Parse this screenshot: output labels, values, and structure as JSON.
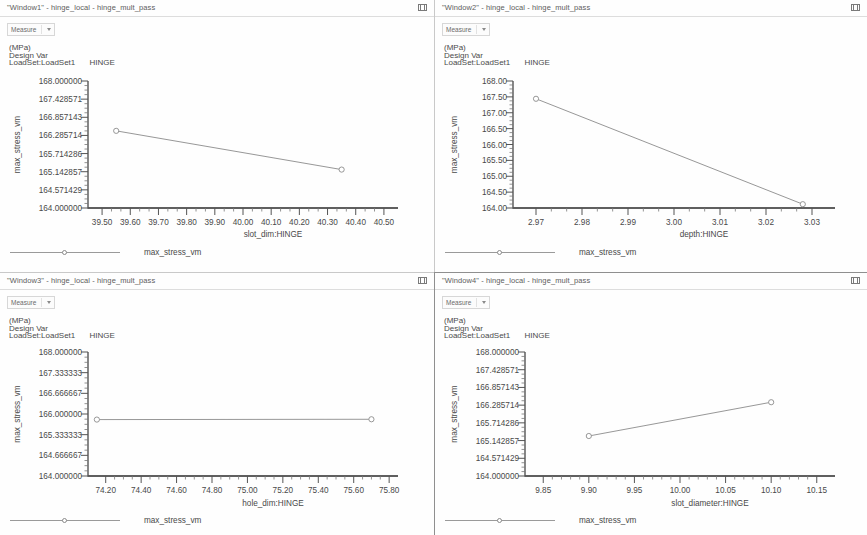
{
  "app": {
    "measure_label": "Measure",
    "close_icon": "window-close-icon",
    "caret_icon": "chevron-down-icon"
  },
  "panels": [
    {
      "title": "\"Window1\" - hinge_local - hinge_mult_pass",
      "info_units": "(MPa)",
      "info_designvar": "Design Var",
      "info_loadset": "LoadSet:LoadSet1",
      "info_hinge": "HINGE",
      "legend_label": "max_stress_vm"
    },
    {
      "title": "\"Window2\" - hinge_local - hinge_mult_pass",
      "info_units": "(MPa)",
      "info_designvar": "Design Var",
      "info_loadset": "LoadSet:LoadSet1",
      "info_hinge": "HINGE",
      "legend_label": "max_stress_vm"
    },
    {
      "title": "\"Window3\" - hinge_local - hinge_mult_pass",
      "info_units": "(MPa)",
      "info_designvar": "Design Var",
      "info_loadset": "LoadSet:LoadSet1",
      "info_hinge": "HINGE",
      "legend_label": "max_stress_vm"
    },
    {
      "title": "\"Window4\" - hinge_local - hinge_mult_pass",
      "info_units": "(MPa)",
      "info_designvar": "Design Var",
      "info_loadset": "LoadSet:LoadSet1",
      "info_hinge": "HINGE",
      "legend_label": "max_stress_vm"
    }
  ],
  "chart_data": [
    {
      "type": "line",
      "title": "",
      "xlabel": "slot_dim:HINGE",
      "ylabel": "max_stress_vm",
      "series": [
        {
          "name": "max_stress_vm",
          "x": [
            39.55,
            40.35
          ],
          "values": [
            166.43,
            165.21
          ]
        }
      ],
      "xlim": [
        39.45,
        40.55
      ],
      "ylim": [
        164.0,
        168.0
      ],
      "xticks": [
        "39.50",
        "39.60",
        "39.70",
        "39.80",
        "39.90",
        "40.00",
        "40.10",
        "40.20",
        "40.30",
        "40.40",
        "40.50"
      ],
      "xtick_values": [
        39.5,
        39.6,
        39.7,
        39.8,
        39.9,
        40.0,
        40.1,
        40.2,
        40.3,
        40.4,
        40.5
      ],
      "yticks": [
        "168.000000",
        "167.428571",
        "166.857143",
        "166.285714",
        "165.714286",
        "165.142857",
        "164.571429",
        "164.000000"
      ],
      "ytick_values": [
        168.0,
        167.428571,
        166.857143,
        166.285714,
        165.714286,
        165.142857,
        164.571429,
        164.0
      ],
      "grid": false,
      "legend_position": "bottom-left"
    },
    {
      "type": "line",
      "title": "",
      "xlabel": "depth:HINGE",
      "ylabel": "max_stress_vm",
      "series": [
        {
          "name": "max_stress_vm",
          "x": [
            2.97,
            3.028
          ],
          "values": [
            167.44,
            164.12
          ]
        }
      ],
      "xlim": [
        2.965,
        3.035
      ],
      "ylim": [
        164.0,
        168.0
      ],
      "xticks": [
        "2.97",
        "2.98",
        "2.99",
        "3.00",
        "3.01",
        "3.02",
        "3.03"
      ],
      "xtick_values": [
        2.97,
        2.98,
        2.99,
        3.0,
        3.01,
        3.02,
        3.03
      ],
      "yticks": [
        "168.00",
        "167.50",
        "167.00",
        "166.50",
        "166.00",
        "165.50",
        "165.00",
        "164.50",
        "164.00"
      ],
      "ytick_values": [
        168.0,
        167.5,
        167.0,
        166.5,
        166.0,
        165.5,
        165.0,
        164.5,
        164.0
      ],
      "grid": false,
      "legend_position": "bottom-left"
    },
    {
      "type": "line",
      "title": "",
      "xlabel": "hole_dim:HINGE",
      "ylabel": "max_stress_vm",
      "series": [
        {
          "name": "max_stress_vm",
          "x": [
            74.15,
            75.7
          ],
          "values": [
            165.82,
            165.83
          ]
        }
      ],
      "xlim": [
        74.1,
        75.85
      ],
      "ylim": [
        164.0,
        168.0
      ],
      "xticks": [
        "74.20",
        "74.40",
        "74.60",
        "74.80",
        "75.00",
        "75.20",
        "75.40",
        "75.60",
        "75.80"
      ],
      "xtick_values": [
        74.2,
        74.4,
        74.6,
        74.8,
        75.0,
        75.2,
        75.4,
        75.6,
        75.8
      ],
      "yticks": [
        "168.000000",
        "167.333333",
        "166.666667",
        "166.000000",
        "165.333333",
        "164.666667",
        "164.000000"
      ],
      "ytick_values": [
        168.0,
        167.333333,
        166.666667,
        166.0,
        165.333333,
        164.666667,
        164.0
      ],
      "grid": false,
      "legend_position": "bottom-left"
    },
    {
      "type": "line",
      "title": "",
      "xlabel": "slot_diameter:HINGE",
      "ylabel": "max_stress_vm",
      "series": [
        {
          "name": "max_stress_vm",
          "x": [
            9.9,
            10.1
          ],
          "values": [
            165.29,
            166.38
          ]
        }
      ],
      "xlim": [
        9.83,
        10.17
      ],
      "ylim": [
        164.0,
        168.0
      ],
      "xticks": [
        "9.85",
        "9.90",
        "9.95",
        "10.00",
        "10.05",
        "10.10",
        "10.15"
      ],
      "xtick_values": [
        9.85,
        9.9,
        9.95,
        10.0,
        10.05,
        10.1,
        10.15
      ],
      "yticks": [
        "168.000000",
        "167.428571",
        "166.857143",
        "166.285714",
        "165.714286",
        "165.142857",
        "164.571429",
        "164.000000"
      ],
      "ytick_values": [
        168.0,
        167.428571,
        166.857143,
        166.285714,
        165.714286,
        165.142857,
        164.571429,
        164.0
      ],
      "grid": false,
      "legend_position": "bottom-left"
    }
  ]
}
